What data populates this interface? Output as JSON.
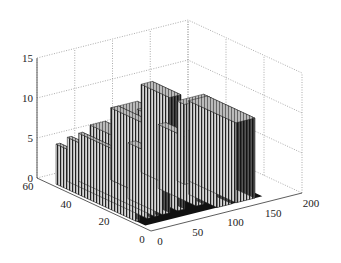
{
  "chart_data": {
    "type": "surface3d",
    "title": "",
    "xlabel": "",
    "ylabel": "",
    "zlabel": "",
    "xlim": [
      0,
      200
    ],
    "ylim": [
      0,
      60
    ],
    "zlim": [
      0,
      15
    ],
    "x_ticks": [
      "0",
      "50",
      "100",
      "150",
      "200"
    ],
    "y_ticks": [
      "0",
      "20",
      "40",
      "60"
    ],
    "z_ticks": [
      "0",
      "5",
      "10",
      "15"
    ],
    "grid": true,
    "blocks": [
      {
        "x": [
          100,
          115
        ],
        "y": [
          30,
          45
        ],
        "z": 11
      },
      {
        "x": [
          115,
          150
        ],
        "y": [
          28,
          32
        ],
        "z": 10
      },
      {
        "x": [
          125,
          150
        ],
        "y": [
          5,
          30
        ],
        "z": 10
      },
      {
        "x": [
          60,
          95
        ],
        "y": [
          30,
          45
        ],
        "z": 9
      },
      {
        "x": [
          60,
          70
        ],
        "y": [
          10,
          45
        ],
        "z": 9
      },
      {
        "x": [
          95,
          100
        ],
        "y": [
          30,
          45
        ],
        "z": 8
      },
      {
        "x": [
          85,
          95
        ],
        "y": [
          10,
          30
        ],
        "z": 8
      },
      {
        "x": [
          100,
          120
        ],
        "y": [
          5,
          20
        ],
        "z": 8
      },
      {
        "x": [
          40,
          60
        ],
        "y": [
          28,
          48
        ],
        "z": 7
      },
      {
        "x": [
          40,
          50
        ],
        "y": [
          10,
          28
        ],
        "z": 7
      },
      {
        "x": [
          30,
          35
        ],
        "y": [
          10,
          50
        ],
        "z": 6
      },
      {
        "x": [
          20,
          25
        ],
        "y": [
          10,
          52
        ],
        "z": 5.5
      },
      {
        "x": [
          5,
          10
        ],
        "y": [
          10,
          52
        ],
        "z": 5
      }
    ]
  }
}
